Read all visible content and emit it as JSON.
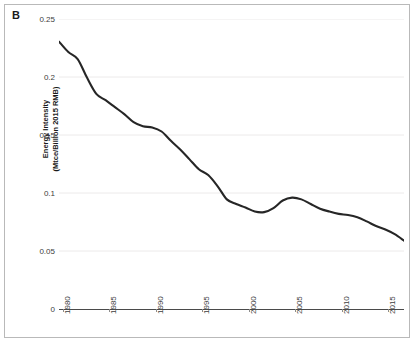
{
  "panel": {
    "label": "B"
  },
  "axes": {
    "y_title_line1": "Energy Intensity",
    "y_title_line2": "(Mtce/Billion 2015 RMB)",
    "y_ticks": [
      "0.25",
      "0.2",
      "0.15",
      "0.1",
      "0.05",
      "0"
    ],
    "x_ticks": [
      "1980",
      "1985",
      "1990",
      "1995",
      "2000",
      "2005",
      "2010",
      "2015"
    ]
  },
  "colors": {
    "line": "#262626",
    "axis": "#4a4a4a",
    "grid": "#eceaea",
    "text": "#3d3d3d",
    "frame": "#b9b9b9",
    "background": "#ffffff"
  },
  "chart_data": {
    "type": "line",
    "title": "",
    "subtitle": "",
    "xlabel": "",
    "ylabel": "Energy Intensity (Mtce/Billion 2015 RMB)",
    "xlim": [
      1980,
      2017
    ],
    "ylim": [
      0,
      0.25
    ],
    "grid": true,
    "legend": null,
    "x_tick_values": [
      1980,
      1985,
      1990,
      1995,
      2000,
      2005,
      2010,
      2015
    ],
    "y_tick_values": [
      0,
      0.05,
      0.1,
      0.15,
      0.2,
      0.25
    ],
    "series": [
      {
        "name": "Energy Intensity",
        "color": "#262626",
        "x": [
          1980,
          1981,
          1982,
          1983,
          1984,
          1985,
          1986,
          1987,
          1988,
          1989,
          1990,
          1991,
          1992,
          1993,
          1994,
          1995,
          1996,
          1997,
          1998,
          1999,
          2000,
          2001,
          2002,
          2003,
          2004,
          2005,
          2006,
          2007,
          2008,
          2009,
          2010,
          2011,
          2012,
          2013,
          2014,
          2015,
          2016,
          2017
        ],
        "values": [
          0.2305,
          0.2215,
          0.2155,
          0.1995,
          0.1855,
          0.18,
          0.174,
          0.168,
          0.161,
          0.1575,
          0.1565,
          0.153,
          0.145,
          0.1375,
          0.129,
          0.1205,
          0.1155,
          0.106,
          0.0945,
          0.0905,
          0.0875,
          0.084,
          0.0835,
          0.087,
          0.0935,
          0.096,
          0.0945,
          0.0905,
          0.0865,
          0.084,
          0.082,
          0.081,
          0.079,
          0.0755,
          0.0715,
          0.0685,
          0.0645,
          0.059
        ]
      }
    ]
  }
}
